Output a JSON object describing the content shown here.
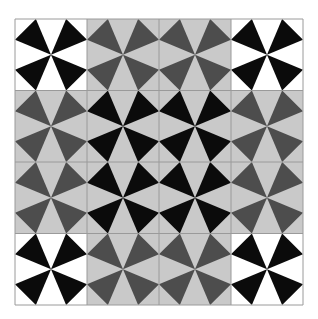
{
  "figure": {
    "type": "tiling-pattern",
    "grid": {
      "rows": 4,
      "cols": 4,
      "left": 15,
      "top": 19,
      "width": 288,
      "height": 286
    },
    "edge_fraction": 0.29,
    "colors": {
      "black": "#0b0b0b",
      "white": "#ffffff",
      "dark_gray": "#4d4d4d",
      "light_gray": "#c9c9c9",
      "grid_line": "#9a9a9a"
    },
    "tiles": [
      [
        {
          "fg": "black",
          "bg": "white"
        },
        {
          "fg": "dark_gray",
          "bg": "light_gray"
        },
        {
          "fg": "dark_gray",
          "bg": "light_gray"
        },
        {
          "fg": "black",
          "bg": "white"
        }
      ],
      [
        {
          "fg": "dark_gray",
          "bg": "light_gray"
        },
        {
          "fg": "black",
          "bg": "light_gray"
        },
        {
          "fg": "black",
          "bg": "light_gray"
        },
        {
          "fg": "dark_gray",
          "bg": "light_gray"
        }
      ],
      [
        {
          "fg": "dark_gray",
          "bg": "light_gray"
        },
        {
          "fg": "black",
          "bg": "light_gray"
        },
        {
          "fg": "black",
          "bg": "light_gray"
        },
        {
          "fg": "dark_gray",
          "bg": "light_gray"
        }
      ],
      [
        {
          "fg": "black",
          "bg": "white"
        },
        {
          "fg": "dark_gray",
          "bg": "light_gray"
        },
        {
          "fg": "dark_gray",
          "bg": "light_gray"
        },
        {
          "fg": "black",
          "bg": "white"
        }
      ]
    ]
  }
}
